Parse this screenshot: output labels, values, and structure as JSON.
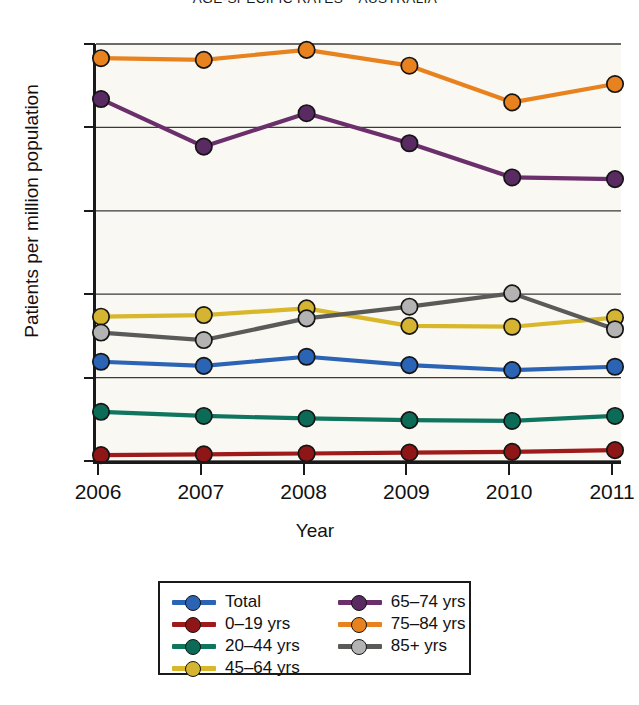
{
  "chart_data": {
    "type": "line",
    "title": "AGE-SPECIFIC RATES – AUSTRALIA",
    "xlabel": "Year",
    "ylabel": "Patients per million population",
    "categories": [
      "2006",
      "2007",
      "2008",
      "2009",
      "2010",
      "2011"
    ],
    "x": [
      2006,
      2007,
      2008,
      2009,
      2010,
      2011
    ],
    "xlim": [
      2006,
      2011
    ],
    "ylim": [
      0,
      500
    ],
    "yticks": [
      0,
      100,
      200,
      300,
      400,
      500
    ],
    "grid": "horizontal",
    "legend_position": "bottom",
    "series": [
      {
        "name": "Total",
        "color": "#2b64b4",
        "values": [
          119,
          114,
          125,
          115,
          109,
          113
        ]
      },
      {
        "name": "0–19 yrs",
        "color": "#9e1b1b",
        "values": [
          7,
          8,
          9,
          10,
          11,
          13
        ]
      },
      {
        "name": "20–44 yrs",
        "color": "#10755f",
        "values": [
          59,
          54,
          51,
          49,
          48,
          54
        ]
      },
      {
        "name": "45–64 yrs",
        "color": "#d8b72a",
        "values": [
          173,
          175,
          183,
          162,
          161,
          172
        ]
      },
      {
        "name": "65–74 yrs",
        "color": "#6b2f6b",
        "values": [
          434,
          377,
          417,
          381,
          340,
          338
        ]
      },
      {
        "name": "75–84 yrs",
        "color": "#e8821e",
        "values": [
          483,
          481,
          493,
          474,
          430,
          452
        ]
      },
      {
        "name": "85+ yrs",
        "color": "#5a5a58",
        "values": [
          154,
          145,
          171,
          185,
          201,
          158
        ]
      }
    ],
    "marker_fill": {
      "Total": "#2b64b4",
      "0–19 yrs": "#8f1616",
      "20–44 yrs": "#0c6b56",
      "45–64 yrs": "#d4b430",
      "65–74 yrs": "#5a2a63",
      "75–84 yrs": "#e8821e",
      "85+ yrs": "#b3b3b3"
    },
    "marker_edge": "#151515"
  },
  "axes": {
    "y_tick_labels": [
      "500",
      "400",
      "300",
      "200",
      "100",
      "0"
    ],
    "x_tick_labels": [
      "2006",
      "2007",
      "2008",
      "2009",
      "2010",
      "2011"
    ]
  },
  "legend": {
    "column_left": [
      "Total",
      "0–19 yrs",
      "20–44 yrs",
      "45–64 yrs"
    ],
    "column_right": [
      "65–74 yrs",
      "75–84 yrs",
      "85+ yrs"
    ]
  },
  "colors": {
    "plot_background": "#faf8f2",
    "axis": "#1a1a1a",
    "gridline": "#3a3a38",
    "page_background": "#ffffff"
  }
}
